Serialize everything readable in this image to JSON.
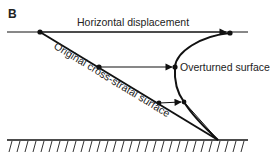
{
  "panel_label": "B",
  "labels": {
    "horizontal_displacement": "Horizontal displacement",
    "overturned_surface": "Overturned surface",
    "original_surface": "Original cross-stratal surface"
  },
  "colors": {
    "stroke": "#111111",
    "text": "#222222",
    "background": "#ffffff"
  },
  "geometry": {
    "horizontal_line_y": 32,
    "ground_line_y": 140,
    "apex": [
      218,
      140
    ],
    "top_origin": [
      40,
      32
    ],
    "top_displaced": [
      230,
      33
    ],
    "mid_origin": [
      99,
      67
    ],
    "mid_displaced": [
      175,
      67
    ],
    "low_origin": [
      159,
      103
    ],
    "low_displaced": [
      184,
      102
    ]
  }
}
